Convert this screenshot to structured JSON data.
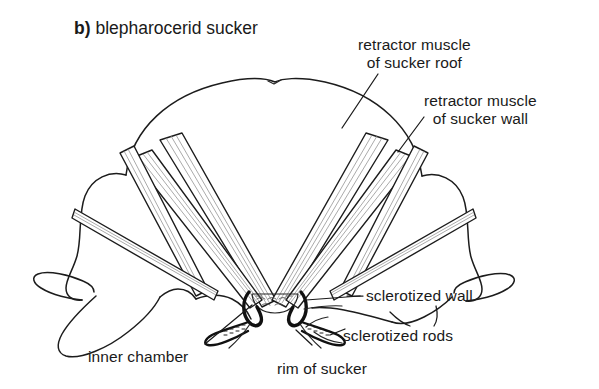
{
  "figure": {
    "panel_tag": "b)",
    "panel_title": "blepharocerid sucker",
    "background_color": "#ffffff",
    "ink_color": "#1a1a1a"
  },
  "labels": {
    "retractor_roof": {
      "line1": "retractor muscle",
      "line2": "of sucker roof"
    },
    "retractor_wall": {
      "line1": "retractor muscle",
      "line2": "of sucker wall"
    },
    "sclerotized_wall": "sclerotized wall",
    "sclerotized_rods": "sclerotized rods",
    "inner_chamber": "inner chamber",
    "rim_of_sucker": "rim of sucker"
  }
}
